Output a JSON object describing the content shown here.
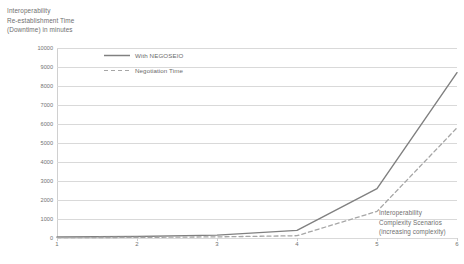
{
  "chart_data": {
    "type": "line",
    "title": "",
    "ylabel_lines": [
      "Interoperability",
      "Re-establishment Time",
      "(Downtime) in minutes"
    ],
    "xlabel_lines": [
      "Interoperability",
      "Complexity Scenarios",
      "(increasing complexity)"
    ],
    "xlabel": "Interoperability Complexity Scenarios (increasing complexity)",
    "ylabel": "Interoperability Re-establishment Time (Downtime) in minutes",
    "categories": [
      "1",
      "2",
      "3",
      "4",
      "5",
      "6"
    ],
    "x": [
      1,
      2,
      3,
      4,
      5,
      6
    ],
    "xlim": [
      1,
      6
    ],
    "ylim": [
      0,
      10000
    ],
    "ytick_step": 1000,
    "yticks": [
      0,
      1000,
      2000,
      3000,
      4000,
      5000,
      6000,
      7000,
      8000,
      9000,
      10000
    ],
    "ytick_labels": [
      "0",
      "1000",
      "2000",
      "3000",
      "4000",
      "5000",
      "6000",
      "7000",
      "8000",
      "9000",
      "10000"
    ],
    "xticks": [
      1,
      2,
      3,
      4,
      5,
      6
    ],
    "xtick_labels": [
      "1",
      "2",
      "3",
      "4",
      "5",
      "6"
    ],
    "grid": "horizontal",
    "legend_position": "top-center",
    "series": [
      {
        "name": "With NEGOSEIO",
        "style": "solid",
        "color": "#808080",
        "values": [
          50,
          80,
          150,
          400,
          2600,
          8700
        ]
      },
      {
        "name": "Negotiation Time",
        "style": "dashed",
        "color": "#a6a6a6",
        "values": [
          20,
          30,
          60,
          120,
          1400,
          5800
        ]
      }
    ]
  },
  "colors": {
    "series_solid": "#808080",
    "series_dashed": "#a6a6a6",
    "gridline": "#d9d9d9",
    "axis": "#c8c8c8",
    "text": "#6f6f6f",
    "background": "#ffffff"
  }
}
